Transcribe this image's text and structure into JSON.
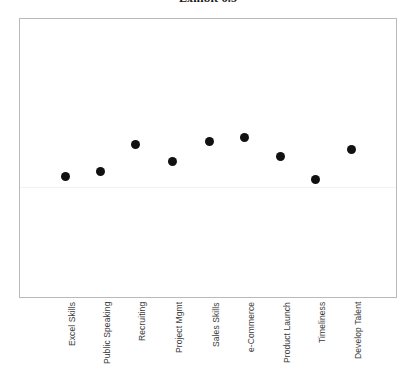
{
  "chart_data": {
    "type": "scatter",
    "title": "Exhibit 6.5",
    "xlabel": "",
    "ylabel": "",
    "grid": true,
    "gridlines_y": [
      0
    ],
    "legend": "none",
    "ylim": [
      -1.6,
      2.4
    ],
    "categories": [
      "Excel Skills",
      "Public Speaking",
      "Recruiting",
      "Project Mgmt",
      "Sales Skills",
      "e-Commerce",
      "Product Launch",
      "Timeliness",
      "Develop Talent"
    ],
    "values": [
      -0.6,
      -0.4,
      0.55,
      -0.1,
      0.65,
      0.8,
      0.0,
      -0.75,
      0.3
    ],
    "series": [
      {
        "name": "Rating",
        "marker": "circle",
        "color": "#111111",
        "values": [
          -0.6,
          -0.4,
          0.55,
          -0.1,
          0.65,
          0.8,
          0.0,
          -0.75,
          0.3
        ]
      }
    ],
    "point_pixels": [
      {
        "x": 64,
        "y": 175
      },
      {
        "x": 99,
        "y": 170
      },
      {
        "x": 134,
        "y": 143
      },
      {
        "x": 171,
        "y": 160
      },
      {
        "x": 208,
        "y": 140
      },
      {
        "x": 243,
        "y": 136
      },
      {
        "x": 279,
        "y": 155
      },
      {
        "x": 314,
        "y": 178
      },
      {
        "x": 350,
        "y": 148
      }
    ],
    "colors": {
      "marker": "#111111",
      "frame": "#b9b9b9",
      "gridline": "#f1f1f1",
      "background": "#ffffff",
      "label": "#3a3a3a"
    }
  }
}
